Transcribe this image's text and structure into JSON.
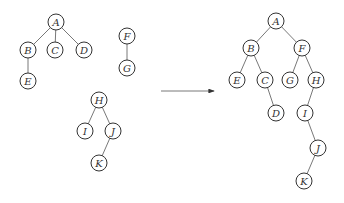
{
  "diagram": {
    "node_radius": 8,
    "colors": {
      "stroke": "#333333",
      "edge": "#555555",
      "background": "#ffffff"
    },
    "forest": {
      "nodes": [
        {
          "id": "A",
          "x": 56,
          "y": 22
        },
        {
          "id": "B",
          "x": 28,
          "y": 50
        },
        {
          "id": "C",
          "x": 55,
          "y": 50
        },
        {
          "id": "D",
          "x": 84,
          "y": 50
        },
        {
          "id": "E",
          "x": 28,
          "y": 81
        },
        {
          "id": "F",
          "x": 127,
          "y": 36
        },
        {
          "id": "G",
          "x": 127,
          "y": 68
        },
        {
          "id": "H",
          "x": 99,
          "y": 100
        },
        {
          "id": "I",
          "x": 85,
          "y": 131
        },
        {
          "id": "J",
          "x": 113,
          "y": 131
        },
        {
          "id": "K",
          "x": 99,
          "y": 163
        }
      ],
      "edges": [
        [
          "A",
          "B"
        ],
        [
          "A",
          "C"
        ],
        [
          "A",
          "D"
        ],
        [
          "B",
          "E"
        ],
        [
          "F",
          "G"
        ],
        [
          "H",
          "I"
        ],
        [
          "H",
          "J"
        ],
        [
          "J",
          "K"
        ]
      ]
    },
    "arrow": {
      "x1": 161,
      "y1": 91,
      "x2": 214,
      "y2": 91
    },
    "binary_tree": {
      "nodes": [
        {
          "id": "A",
          "x": 276,
          "y": 21
        },
        {
          "id": "B",
          "x": 251,
          "y": 48
        },
        {
          "id": "F",
          "x": 302,
          "y": 48
        },
        {
          "id": "E",
          "x": 237,
          "y": 80
        },
        {
          "id": "C",
          "x": 265,
          "y": 80
        },
        {
          "id": "G",
          "x": 290,
          "y": 80
        },
        {
          "id": "H",
          "x": 316,
          "y": 80
        },
        {
          "id": "D",
          "x": 276,
          "y": 113
        },
        {
          "id": "I",
          "x": 305,
          "y": 113
        },
        {
          "id": "J",
          "x": 318,
          "y": 148
        },
        {
          "id": "K",
          "x": 304,
          "y": 181
        }
      ],
      "edges": [
        [
          "A",
          "B"
        ],
        [
          "A",
          "F"
        ],
        [
          "B",
          "E"
        ],
        [
          "B",
          "C"
        ],
        [
          "F",
          "G"
        ],
        [
          "F",
          "H"
        ],
        [
          "C",
          "D"
        ],
        [
          "H",
          "I"
        ],
        [
          "I",
          "J"
        ],
        [
          "J",
          "K"
        ]
      ]
    }
  }
}
